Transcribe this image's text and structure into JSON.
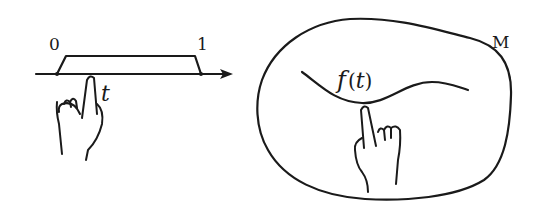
{
  "left_panel": {
    "interval_start_label": "0",
    "interval_end_label": "1",
    "parameter_label": "t",
    "description": "Number line with interval [0,1]; a finger points at parameter t"
  },
  "right_panel": {
    "manifold_label": "M",
    "curve_label_f": "f",
    "curve_label_open": "(",
    "curve_label_t": "t",
    "curve_label_close": ")",
    "description": "Blob-shaped manifold M containing a curve; a finger points at the point f(t)"
  },
  "colors": {
    "ink": "#1a1a1a",
    "background": "#ffffff"
  }
}
